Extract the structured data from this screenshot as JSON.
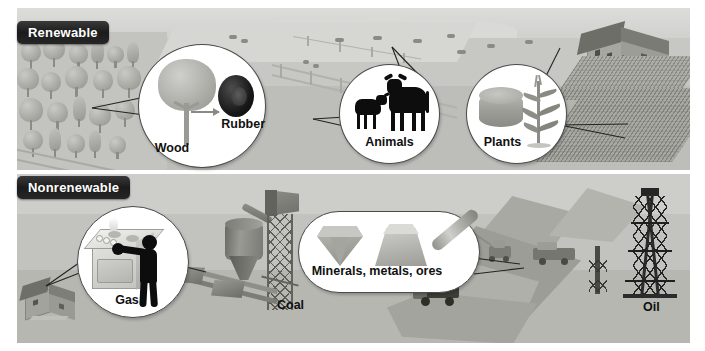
{
  "figure": {
    "type": "infographic",
    "background_color": "#ffffff"
  },
  "panels": [
    {
      "id": "renewable",
      "banner_label": "Renewable",
      "banner_bg": "#1b1b1b",
      "banner_text_color": "#ffffff",
      "scene": "countryside with forest, pasture, farmhouse and cornfield",
      "callouts": [
        {
          "id": "wood",
          "shape": "circle",
          "label": "Wood",
          "secondary_label": "Rubber",
          "icons": [
            "tree-icon",
            "tire-icon",
            "arrow-right-icon"
          ],
          "points_to": "forest"
        },
        {
          "id": "animals",
          "shape": "circle",
          "label": "Animals",
          "icons": [
            "cow-icon",
            "calf-icon"
          ],
          "points_to": "pasture livestock"
        },
        {
          "id": "plants",
          "shape": "circle",
          "label": "Plants",
          "icons": [
            "hay-bale-icon",
            "corn-stalk-icon"
          ],
          "points_to": "farmhouse and cornfield"
        }
      ]
    },
    {
      "id": "nonrenewable",
      "banner_label": "Nonrenewable",
      "banner_bg": "#1b1b1b",
      "banner_text_color": "#ffffff",
      "scene": "industrial landscape with house, coal plant, open-pit mine and oil derrick",
      "callouts": [
        {
          "id": "gas",
          "shape": "circle",
          "label": "Gas",
          "icons": [
            "gas-stove-icon",
            "person-icon",
            "flame-icon"
          ],
          "points_to": "house"
        },
        {
          "id": "minerals",
          "shape": "pill",
          "label": "Minerals, metals, ores",
          "icons": [
            "gem-icon",
            "gold-ingot-icon",
            "metal-pipe-icon"
          ],
          "points_to": "open-pit mine"
        }
      ],
      "scene_labels": [
        {
          "id": "coal",
          "label": "Coal"
        },
        {
          "id": "oil",
          "label": "Oil"
        }
      ]
    }
  ],
  "palette": {
    "sky_light": "#d2d2d0",
    "ground_mid": "#bfbfbb",
    "ground_dark": "#a9a9a4",
    "silhouette": "#0d0d0d",
    "bubble_fill": "#ffffff",
    "bubble_stroke": "#4a4a4a",
    "metal": "#6f6f6a",
    "derrick": "#2c2c2c"
  }
}
